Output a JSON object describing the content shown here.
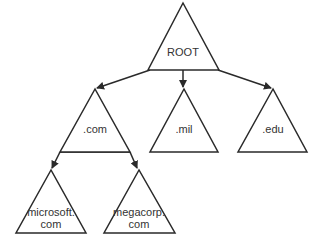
{
  "diagram": {
    "type": "tree",
    "nodes": [
      {
        "id": "root",
        "label_lines": [
          "ROOT"
        ]
      },
      {
        "id": "com",
        "label_lines": [
          ".com"
        ]
      },
      {
        "id": "mil",
        "label_lines": [
          ".mil"
        ]
      },
      {
        "id": "edu",
        "label_lines": [
          ".edu"
        ]
      },
      {
        "id": "microsoft",
        "label_lines": [
          "microsoft.",
          "com"
        ]
      },
      {
        "id": "megacorp",
        "label_lines": [
          "megacorp.",
          "com"
        ]
      }
    ],
    "edges": [
      {
        "from": "root",
        "to": "com"
      },
      {
        "from": "root",
        "to": "mil"
      },
      {
        "from": "root",
        "to": "edu"
      },
      {
        "from": "com",
        "to": "microsoft"
      },
      {
        "from": "com",
        "to": "megacorp"
      }
    ]
  }
}
